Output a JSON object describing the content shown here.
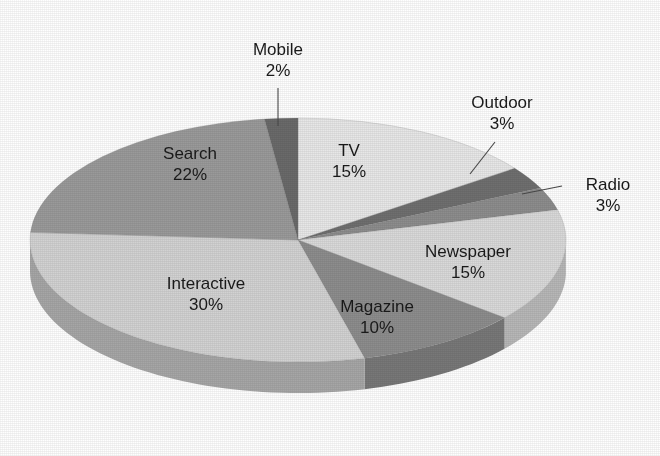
{
  "chart_data": {
    "type": "pie",
    "title": "",
    "subtitle": "",
    "xlabel": "",
    "ylabel": "",
    "legend_position": "none",
    "grid": false,
    "three_d": true,
    "start_angle_deg": 0,
    "direction": "clockwise",
    "categories": [
      "TV",
      "Outdoor",
      "Radio",
      "Newspaper",
      "Magazine",
      "Interactive",
      "Search",
      "Mobile"
    ],
    "values": [
      15,
      3,
      3,
      15,
      10,
      30,
      22,
      2
    ],
    "unit": "%",
    "slices": [
      {
        "label": "TV",
        "value": 15,
        "value_text": "15%",
        "color": "#e7e7e7",
        "side_color": "#c4c4c4",
        "label_placement": "inside",
        "label_x": 349,
        "label_y": 152
      },
      {
        "label": "Outdoor",
        "value": 3,
        "value_text": "3%",
        "color": "#6f6f6f",
        "side_color": "#5d5d5d",
        "label_placement": "outside",
        "label_x": 502,
        "label_y": 108
      },
      {
        "label": "Radio",
        "value": 3,
        "value_text": "3%",
        "color": "#8d8d8d",
        "side_color": "#777777",
        "label_placement": "outside",
        "label_x": 608,
        "label_y": 190
      },
      {
        "label": "Newspaper",
        "value": 15,
        "value_text": "15%",
        "color": "#d9d9d9",
        "side_color": "#b7b7b7",
        "label_placement": "inside",
        "label_x": 468,
        "label_y": 253
      },
      {
        "label": "Magazine",
        "value": 10,
        "value_text": "10%",
        "color": "#8d8d8d",
        "side_color": "#787878",
        "label_placement": "inside",
        "label_x": 377,
        "label_y": 308
      },
      {
        "label": "Interactive",
        "value": 30,
        "value_text": "30%",
        "color": "#d2d2d2",
        "side_color": "#a6a6a6",
        "label_placement": "inside",
        "label_x": 206,
        "label_y": 285
      },
      {
        "label": "Search",
        "value": 22,
        "value_text": "22%",
        "color": "#9a9a9a",
        "side_color": "#848484",
        "label_placement": "inside",
        "label_x": 190,
        "label_y": 155
      },
      {
        "label": "Mobile",
        "value": 2,
        "value_text": "2%",
        "color": "#6a6a6a",
        "side_color": "#5a5a5a",
        "label_placement": "outside",
        "label_x": 278,
        "label_y": 55
      }
    ],
    "callouts": [
      {
        "label": "Mobile",
        "x1": 278,
        "y1": 88,
        "x2": 278,
        "y2": 126
      },
      {
        "label": "Outdoor",
        "x1": 495,
        "y1": 142,
        "x2": 470,
        "y2": 174
      },
      {
        "label": "Radio",
        "x1": 562,
        "y1": 186,
        "x2": 522,
        "y2": 194
      }
    ],
    "geometry": {
      "center_x": 298,
      "center_y": 240,
      "radius_x": 268,
      "radius_y": 122,
      "depth": 31
    }
  }
}
